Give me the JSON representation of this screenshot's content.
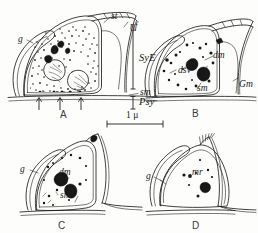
{
  "figure": {
    "background_color": "#fdfdfc",
    "ink_color": "#1b1b1b",
    "panels": [
      {
        "id": "A",
        "letter": "A",
        "description": "synaptic ending densely filled with stippled granules and dark granular clusters, bracketed at right, three arrows beneath baseline",
        "labels": [
          {
            "name": "st",
            "text": "st"
          },
          {
            "name": "nf",
            "text": "nf"
          },
          {
            "name": "g",
            "text": "g"
          },
          {
            "name": "SyE",
            "text": "SyE"
          },
          {
            "name": "sm",
            "text": "sm"
          },
          {
            "name": "Psy",
            "text": "Psy"
          }
        ],
        "arrow_count": 3
      },
      {
        "id": "B",
        "letter": "B",
        "description": "profile with sparse dark inclusions, dense-core vesicle and dense body",
        "labels": [
          {
            "name": "dm",
            "text": "dm"
          },
          {
            "name": "dsv",
            "text": "dsv"
          },
          {
            "name": "sm",
            "text": "sm"
          },
          {
            "name": "Gm",
            "text": "Gm"
          }
        ]
      },
      {
        "id": "C",
        "letter": "C",
        "description": "profile with two dark dense masses centrally and a few small granules",
        "labels": [
          {
            "name": "g",
            "text": "g"
          },
          {
            "name": "dm",
            "text": "dm"
          },
          {
            "name": "sm",
            "text": "sm"
          }
        ]
      },
      {
        "id": "D",
        "letter": "D",
        "description": "profile with bristled apex and small dark membrane remnant cluster",
        "labels": [
          {
            "name": "g",
            "text": "g"
          },
          {
            "name": "mr",
            "text": "mr"
          }
        ]
      }
    ],
    "scale_bar": {
      "label": "1 μ",
      "length_px": 56
    }
  }
}
